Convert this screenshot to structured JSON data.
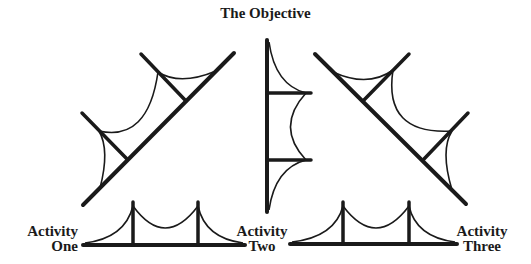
{
  "diagram": {
    "title": "The Objective",
    "labels": {
      "activity_one": {
        "line1": "Activity",
        "line2": "One"
      },
      "activity_two": {
        "line1": "Activity",
        "line2": "Two"
      },
      "activity_three": {
        "line1": "Activity",
        "line2": "Three"
      }
    },
    "elements": [
      {
        "id": "bridge-left-diagonal",
        "description": "Suspension bridge tilted diagonally rising to the right"
      },
      {
        "id": "bridge-center-vertical",
        "description": "Suspension bridge standing vertically below the title"
      },
      {
        "id": "bridge-right-diagonal",
        "description": "Suspension bridge tilted diagonally falling to the right"
      },
      {
        "id": "bridge-bottom-left",
        "description": "Horizontal suspension bridge between Activity One and Activity Two"
      },
      {
        "id": "bridge-bottom-right",
        "description": "Horizontal suspension bridge between Activity Two and Activity Three"
      }
    ],
    "colors": {
      "ink": "#1a1a1a",
      "background": "#ffffff"
    }
  }
}
